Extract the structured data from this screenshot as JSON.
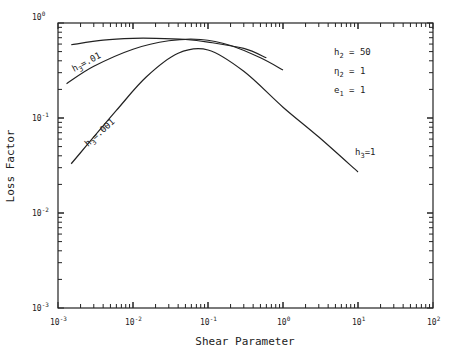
{
  "chart_data": {
    "type": "line",
    "title": "",
    "xlabel": "Shear Parameter",
    "ylabel": "Loss Factor",
    "xscale": "log",
    "yscale": "log",
    "xlim": [
      0.001,
      100
    ],
    "ylim": [
      0.001,
      1
    ],
    "grid": false,
    "x_tick_labels": [
      "10^-3",
      "10^-2",
      "10^-1",
      "10^0",
      "10^1",
      "10^2"
    ],
    "y_tick_labels": [
      "10^0",
      "10^-1",
      "10^-2",
      "10^-3"
    ],
    "annotations": [
      {
        "text": "h2 = 50"
      },
      {
        "text": "η2 = 1"
      },
      {
        "text": "e1 = 1"
      }
    ],
    "series": [
      {
        "name": "h3=.1",
        "x": [
          0.0015,
          0.004,
          0.01,
          0.02,
          0.05,
          0.1,
          0.3,
          0.6
        ],
        "y": [
          0.59,
          0.66,
          0.69,
          0.69,
          0.67,
          0.63,
          0.54,
          0.43
        ]
      },
      {
        "name": "h3=.01",
        "x": [
          0.0013,
          0.003,
          0.01,
          0.03,
          0.08,
          0.2,
          0.5,
          1.0
        ],
        "y": [
          0.23,
          0.35,
          0.53,
          0.65,
          0.67,
          0.58,
          0.43,
          0.32
        ]
      },
      {
        "name": "h3=.001 / h3=1",
        "x": [
          0.0015,
          0.006,
          0.015,
          0.04,
          0.1,
          0.3,
          1.0,
          3.0,
          10.0
        ],
        "y": [
          0.033,
          0.12,
          0.27,
          0.48,
          0.52,
          0.31,
          0.13,
          0.063,
          0.027
        ]
      }
    ],
    "curve_labels": [
      {
        "text": "h3=.01",
        "series": "h3=.01"
      },
      {
        "text": "h3=.001",
        "series": "h3=.001 / h3=1"
      },
      {
        "text": "h3=1",
        "series": "h3=.001 / h3=1"
      }
    ]
  }
}
